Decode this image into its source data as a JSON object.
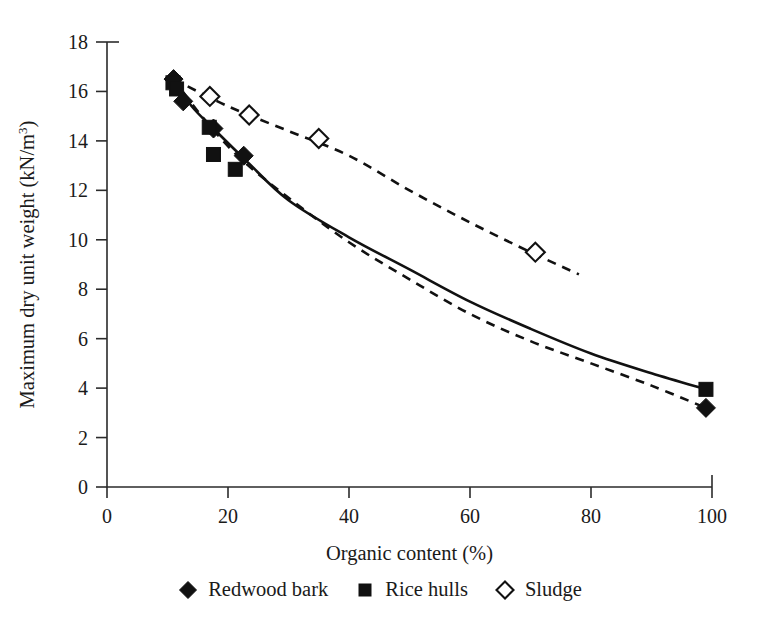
{
  "chart_data": {
    "type": "scatter",
    "title": "",
    "xlabel": "Organic content (%)",
    "ylabel": "Maximum dry unit weight (kN/m",
    "ylabel_sup": "3",
    "ylabel_tail": ")",
    "xlim": [
      0,
      100
    ],
    "ylim": [
      0,
      18
    ],
    "xticks": [
      "0",
      "20",
      "40",
      "60",
      "80",
      "100"
    ],
    "xtick_values": [
      0,
      20,
      40,
      60,
      80,
      100
    ],
    "yticks": [
      "0",
      "2",
      "4",
      "6",
      "8",
      "10",
      "12",
      "14",
      "16",
      "18"
    ],
    "ytick_values": [
      0,
      2,
      4,
      6,
      8,
      10,
      12,
      14,
      16,
      18
    ],
    "grid": false,
    "legend_position": "bottom-center",
    "series": [
      {
        "name": "Redwood bark",
        "marker": "filled-diamond",
        "trend": "solid",
        "points": [
          {
            "x": 11.0,
            "y": 16.5
          },
          {
            "x": 12.6,
            "y": 15.6
          },
          {
            "x": 17.6,
            "y": 14.5
          },
          {
            "x": 22.6,
            "y": 13.4
          },
          {
            "x": 99.0,
            "y": 3.2
          }
        ]
      },
      {
        "name": "Rice hulls",
        "marker": "filled-square",
        "trend": "none",
        "points": [
          {
            "x": 10.9,
            "y": 16.35
          },
          {
            "x": 11.5,
            "y": 16.1
          },
          {
            "x": 16.9,
            "y": 14.55
          },
          {
            "x": 17.6,
            "y": 13.45
          },
          {
            "x": 21.2,
            "y": 12.85
          },
          {
            "x": 99.0,
            "y": 3.95
          }
        ]
      },
      {
        "name": "Sludge",
        "marker": "open-diamond",
        "trend": "dashed",
        "points": [
          {
            "x": 17.0,
            "y": 15.8
          },
          {
            "x": 23.5,
            "y": 15.05
          },
          {
            "x": 35.0,
            "y": 14.1
          },
          {
            "x": 70.8,
            "y": 9.5
          }
        ]
      }
    ],
    "trend_curves": [
      {
        "name": "organic-solid-trend",
        "style": "solid",
        "points": [
          {
            "x": 11.0,
            "y": 16.5
          },
          {
            "x": 14.0,
            "y": 15.4
          },
          {
            "x": 18.0,
            "y": 14.4
          },
          {
            "x": 23.0,
            "y": 13.2
          },
          {
            "x": 30.0,
            "y": 11.6
          },
          {
            "x": 40.0,
            "y": 10.1
          },
          {
            "x": 50.0,
            "y": 8.8
          },
          {
            "x": 60.0,
            "y": 7.5
          },
          {
            "x": 70.0,
            "y": 6.4
          },
          {
            "x": 80.0,
            "y": 5.4
          },
          {
            "x": 90.0,
            "y": 4.6
          },
          {
            "x": 99.0,
            "y": 3.95
          }
        ]
      },
      {
        "name": "organic-dashed-trend",
        "style": "dashed",
        "points": [
          {
            "x": 11.0,
            "y": 16.5
          },
          {
            "x": 16.0,
            "y": 14.9
          },
          {
            "x": 22.0,
            "y": 13.3
          },
          {
            "x": 30.0,
            "y": 11.7
          },
          {
            "x": 40.0,
            "y": 9.9
          },
          {
            "x": 50.0,
            "y": 8.4
          },
          {
            "x": 60.0,
            "y": 7.0
          },
          {
            "x": 70.0,
            "y": 5.9
          },
          {
            "x": 80.0,
            "y": 5.0
          },
          {
            "x": 90.0,
            "y": 4.1
          },
          {
            "x": 99.0,
            "y": 3.2
          }
        ]
      },
      {
        "name": "sludge-dashed-trend",
        "style": "dashed",
        "points": [
          {
            "x": 11.0,
            "y": 16.5
          },
          {
            "x": 20.0,
            "y": 15.4
          },
          {
            "x": 30.0,
            "y": 14.4
          },
          {
            "x": 40.0,
            "y": 13.4
          },
          {
            "x": 50.0,
            "y": 12.0
          },
          {
            "x": 60.0,
            "y": 10.7
          },
          {
            "x": 70.0,
            "y": 9.5
          },
          {
            "x": 78.0,
            "y": 8.6
          }
        ]
      }
    ]
  },
  "legend": {
    "items": [
      {
        "label": "Redwood bark",
        "marker": "filled-diamond"
      },
      {
        "label": "Rice hulls",
        "marker": "filled-square"
      },
      {
        "label": "Sludge",
        "marker": "open-diamond"
      }
    ]
  }
}
